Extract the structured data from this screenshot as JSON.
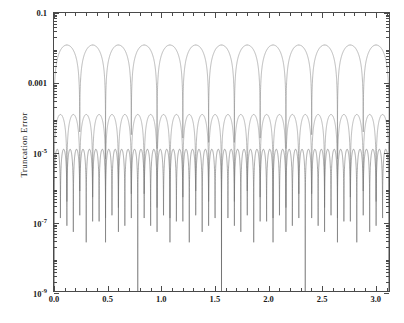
{
  "figure": {
    "background": "#ffffff",
    "frame_color": "#4a4a4a"
  },
  "axes": {
    "ylabel": "Truncation Error",
    "xlabel": "",
    "title": ""
  },
  "chart_data": {
    "type": "line",
    "title": "",
    "xlabel": "",
    "ylabel": "Truncation Error",
    "xlim": [
      0.0,
      3.14159
    ],
    "ylim": [
      1e-09,
      0.1
    ],
    "yscale": "log",
    "xscale": "linear",
    "grid": false,
    "legend": null,
    "xticks": [
      0.0,
      0.5,
      1.0,
      1.5,
      2.0,
      2.5,
      3.0
    ],
    "xticklabels": [
      "0.0",
      "0.5",
      "1.0",
      "1.5",
      "2.0",
      "2.5",
      "3.0"
    ],
    "yticks": [
      0.1,
      0.001,
      1e-05,
      1e-07,
      1e-09
    ],
    "yticklabels": [
      "0.1",
      "0.001",
      "10−5",
      "10−7",
      "10−9"
    ],
    "ytick_mantissas": [
      "0.1",
      "0.001",
      "10",
      "10",
      "10"
    ],
    "ytick_exponents": [
      "",
      "",
      "-5",
      "-7",
      "-9"
    ],
    "series": [
      {
        "name": "curve-1",
        "color": "#8c8c8c",
        "lobes": 13,
        "peak": 0.012,
        "peak_decay": 0.0,
        "node_floor": 1e-09,
        "linewidth": 0.6
      },
      {
        "name": "curve-2",
        "color": "#8c8c8c",
        "lobes": 26,
        "peak": 0.00012,
        "peak_decay": 0.0,
        "node_floor": 1e-09,
        "linewidth": 0.6
      },
      {
        "name": "curve-3",
        "color": "#6e6e6e",
        "lobes": 52,
        "peak": 1.2e-05,
        "peak_decay": 0.0,
        "node_floor": 1e-09,
        "linewidth": 0.6
      }
    ],
    "notable_features": [
      {
        "label": "deepest-node",
        "x": 0.55,
        "y": 1e-09
      }
    ]
  }
}
